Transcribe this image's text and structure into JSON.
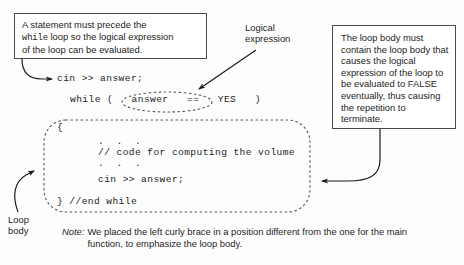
{
  "figure": {
    "callout_left": {
      "line1": "A statement must precede the",
      "line2_code": "while",
      "line2_rest": " loop so the logical expression",
      "line3": "of the loop can be evaluated."
    },
    "label_logical": "Logical\nexpression",
    "callout_right": {
      "text": "The loop body must contain the loop body that causes the logical expression of the loop to be evaluated to FALSE eventually, thus causing the repetition to terminate."
    },
    "label_loop_body": "Loop\nbody",
    "code": {
      "cin_top": "cin >> answer;",
      "while_line": "while (   answer   ==   YES   )",
      "open_brace": "{",
      "dots_upper": ".  .  .",
      "comment": "// code for computing the volume",
      "dots_lower": ".  .  .",
      "cin_body": "cin >> answer;",
      "end_while": "} //end while"
    },
    "note": {
      "word": "Note:",
      "body": "We placed the left curly brace in a position different from the one for the main function, to emphasize the loop body."
    },
    "colors": {
      "box_border": "#4a4a4a",
      "dashed_border": "#555555",
      "arrow": "#1b1b1b",
      "background": "#fdfdfd",
      "text": "#1d1d1d"
    },
    "shapes": {
      "dashed_loop_body_box": "rounded-dashed-rectangle",
      "dashed_condition_ellipse": "dashed-ellipse"
    }
  }
}
